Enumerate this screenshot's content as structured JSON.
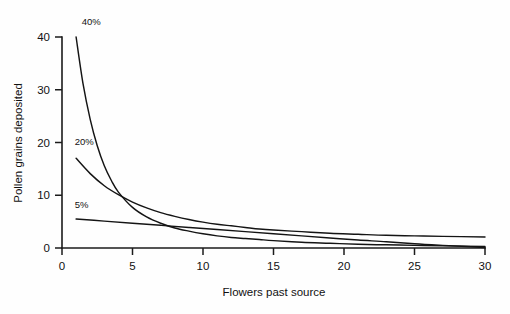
{
  "chart_data": {
    "type": "line",
    "title": "",
    "xlabel": "Flowers past source",
    "ylabel": "Pollen grains deposited",
    "xlim": [
      0,
      30
    ],
    "ylim": [
      0,
      40
    ],
    "xticks": [
      0,
      5,
      10,
      15,
      20,
      25,
      30
    ],
    "yticks": [
      0,
      10,
      20,
      30,
      40
    ],
    "xtick_labels": [
      "0",
      "5",
      "10",
      "15",
      "20",
      "25",
      "30"
    ],
    "ytick_labels": [
      "0",
      "10",
      "20",
      "30",
      "40"
    ],
    "grid": false,
    "legend_position": "inline-annotations",
    "annotations": [
      {
        "text": "40%",
        "x": 1.4,
        "y": 42.2
      },
      {
        "text": "20%",
        "x": 0.9,
        "y": 19.6
      },
      {
        "text": "5%",
        "x": 0.9,
        "y": 7.6
      }
    ],
    "series": [
      {
        "name": "40%",
        "label": "40%",
        "x": [
          1,
          1.5,
          2,
          2.5,
          3,
          3.5,
          4,
          5,
          6,
          7,
          8,
          9,
          10,
          11,
          12,
          13,
          14,
          15,
          17,
          19,
          21,
          23,
          25,
          27,
          30
        ],
        "values": [
          40,
          31,
          24.4,
          19.4,
          15.6,
          12.8,
          10.6,
          7.7,
          5.9,
          4.7,
          3.8,
          3.2,
          2.7,
          2.3,
          2,
          1.8,
          1.6,
          1.4,
          1.1,
          0.9,
          0.7,
          0.6,
          0.5,
          0.4,
          0.3
        ]
      },
      {
        "name": "20%",
        "label": "20%",
        "x": [
          1,
          2,
          3,
          4,
          5,
          6,
          7,
          8,
          9,
          10,
          11,
          12,
          13,
          14,
          15,
          17,
          19,
          21,
          23,
          25,
          27,
          30
        ],
        "values": [
          17,
          14.1,
          11.8,
          10.1,
          8.7,
          7.6,
          6.7,
          6,
          5.4,
          4.9,
          4.5,
          4.2,
          3.9,
          3.6,
          3.4,
          3.1,
          2.8,
          2.6,
          2.4,
          2.3,
          2.2,
          2.1
        ]
      },
      {
        "name": "5%",
        "label": "5%",
        "x": [
          1,
          3,
          5,
          7,
          9,
          11,
          13,
          15,
          17,
          19,
          21,
          23,
          25,
          27,
          30
        ],
        "values": [
          5.5,
          5.1,
          4.7,
          4.3,
          3.9,
          3.5,
          3.1,
          2.7,
          2.3,
          1.9,
          1.5,
          1.2,
          0.8,
          0.5,
          0.1
        ]
      }
    ]
  }
}
